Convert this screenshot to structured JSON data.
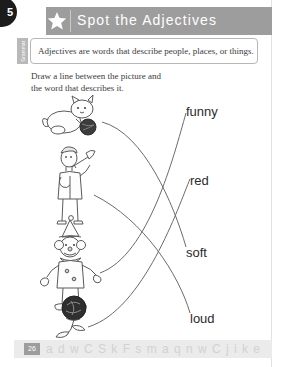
{
  "page": {
    "chapter_badge_number": "5",
    "side_tab_label": "Grammar",
    "page_number": "26",
    "footer_letters": "a d w C S k F s m a q n w C j i k e y z"
  },
  "header": {
    "title": "Spot the Adjectives",
    "star_icon": "star-icon"
  },
  "definition": {
    "text": "Adjectives are words that describe people, places, or things."
  },
  "directions": {
    "line1": "Draw a line between the picture and",
    "line2": "the word that describes it."
  },
  "activity": {
    "pictures": [
      {
        "name": "kitten-playing-with-ball",
        "label": "kitten",
        "matched_word": "soft"
      },
      {
        "name": "person-playing-trumpet",
        "label": "trumpet player",
        "matched_word": "loud"
      },
      {
        "name": "clown",
        "label": "clown",
        "matched_word": "funny"
      },
      {
        "name": "rose",
        "label": "rose",
        "matched_word": "red"
      }
    ],
    "words": [
      {
        "id": "funny",
        "label": "funny"
      },
      {
        "id": "red",
        "label": "red"
      },
      {
        "id": "soft",
        "label": "soft"
      },
      {
        "id": "loud",
        "label": "loud"
      }
    ]
  },
  "colors": {
    "header_band": "#9d9d9d",
    "badge": "#1c1c1c",
    "text": "#3b3b3b",
    "line": "#6b6b6b"
  }
}
